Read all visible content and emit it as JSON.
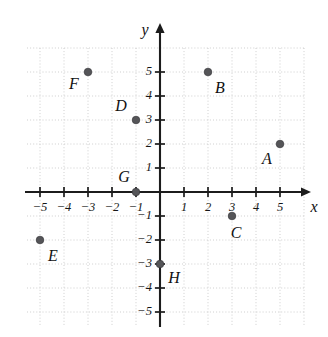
{
  "figure": {
    "kind": "coordinate-plane",
    "x_axis_label": "x",
    "y_axis_label": "y"
  },
  "chart_data": {
    "type": "scatter",
    "title": "",
    "xlabel": "x",
    "ylabel": "y",
    "xlim": [
      -5.6,
      6.0
    ],
    "ylim": [
      -5.5,
      6.0
    ],
    "grid": true,
    "legend": "none",
    "x_ticks": [
      -5,
      -4,
      -3,
      -2,
      -1,
      1,
      2,
      3,
      4,
      5
    ],
    "y_ticks": [
      5,
      4,
      3,
      2,
      1,
      -1,
      -2,
      -3,
      -4,
      -5
    ],
    "x_tick_labels": [
      "−5",
      "−4",
      "−3",
      "−2",
      "−1",
      "1",
      "2",
      "3",
      "4",
      "5"
    ],
    "y_tick_labels": [
      "5",
      "4",
      "3",
      "2",
      "1",
      "−1",
      "−2",
      "−3",
      "−4",
      "−5"
    ],
    "point_color": "#555558",
    "axis_color": "#1c1c1c",
    "grid_color": "#c9c9c9",
    "points": [
      {
        "label": "A",
        "x": 5,
        "y": 2,
        "label_dx": -13,
        "label_dy": 16
      },
      {
        "label": "B",
        "x": 2,
        "y": 5,
        "label_dx": 12,
        "label_dy": 17
      },
      {
        "label": "C",
        "x": 3,
        "y": -1,
        "label_dx": 4,
        "label_dy": 18
      },
      {
        "label": "D",
        "x": -1,
        "y": 3,
        "label_dx": -15,
        "label_dy": -13
      },
      {
        "label": "E",
        "x": -5,
        "y": -2,
        "label_dx": 13,
        "label_dy": 17
      },
      {
        "label": "F",
        "x": -3,
        "y": 5,
        "label_dx": -14,
        "label_dy": 13
      },
      {
        "label": "G",
        "x": -1,
        "y": 0,
        "label_dx": -12,
        "label_dy": -14
      },
      {
        "label": "H",
        "x": 0,
        "y": -3,
        "label_dx": 14,
        "label_dy": 15
      }
    ]
  }
}
